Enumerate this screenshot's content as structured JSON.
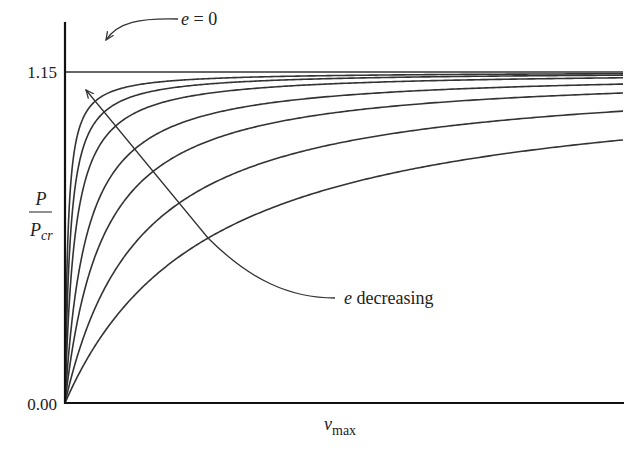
{
  "chart_data": {
    "type": "line",
    "title": "",
    "xlabel": "v_max",
    "ylabel": "P / P_cr",
    "xlim": [
      0,
      1
    ],
    "ylim": [
      0,
      1.15
    ],
    "y_ticks": [
      "0.00",
      "1.15"
    ],
    "x_ticks": [],
    "grid": false,
    "legend": "none",
    "series": [
      {
        "name": "e = 0",
        "asymptote": 1.15,
        "end_value": 1.15
      },
      {
        "name": "curve-1",
        "asymptote": 1.15,
        "end_value": 1.144
      },
      {
        "name": "curve-2",
        "asymptote": 1.15,
        "end_value": 1.139
      },
      {
        "name": "curve-3",
        "asymptote": 1.15,
        "end_value": 1.13
      },
      {
        "name": "curve-4",
        "asymptote": 1.15,
        "end_value": 1.108
      },
      {
        "name": "curve-5",
        "asymptote": 1.15,
        "end_value": 1.077
      },
      {
        "name": "curve-6",
        "asymptote": 1.15,
        "end_value": 1.014
      },
      {
        "name": "curve-7",
        "asymptote": 1.15,
        "end_value": 0.914
      }
    ],
    "annotations": [
      {
        "text_italic": "e",
        "text": " = 0",
        "points_to": "e = 0 line"
      },
      {
        "text_italic": "e",
        "text": " decreasing",
        "direction": "toward upper curves"
      }
    ]
  },
  "labels": {
    "y_top": "1.15",
    "y_bottom": "0.00",
    "y_axis_num": "P",
    "y_axis_den": "P",
    "y_axis_den_sub": "cr",
    "x_axis": "v",
    "x_axis_sub": "max",
    "e_symbol": "e",
    "e_zero_rest": " = 0",
    "e_decreasing_rest": " decreasing"
  }
}
